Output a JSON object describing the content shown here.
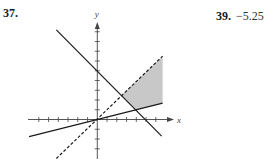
{
  "problems": [
    {
      "number": "37.",
      "kind": "graph"
    },
    {
      "number": "39.",
      "answer": "−5.25"
    }
  ],
  "chart_data": {
    "type": "region-graph",
    "title": "",
    "xlabel": "x",
    "ylabel": "y",
    "xlim": [
      -7,
      7
    ],
    "ylim": [
      -4,
      10
    ],
    "x_ticks": [
      -6,
      -5,
      -4,
      -3,
      -2,
      -1,
      1,
      2,
      3,
      4,
      5,
      6
    ],
    "y_ticks": [
      -3,
      -2,
      -1,
      1,
      2,
      3,
      4,
      5,
      6,
      7,
      8,
      9
    ],
    "tick_labels_shown": false,
    "grid": false,
    "lines": [
      {
        "name": "x + y = 5",
        "style": "solid",
        "points": [
          [
            -4.2,
            9.2
          ],
          [
            6.6,
            -1.7
          ]
        ]
      },
      {
        "name": "y = x/4",
        "style": "solid",
        "points": [
          [
            -7,
            -1.75
          ],
          [
            6.7,
            1.675
          ]
        ]
      },
      {
        "name": "y = x",
        "style": "dashed",
        "points": [
          [
            -4.2,
            -4.0
          ],
          [
            6.7,
            6.5
          ]
        ]
      }
    ],
    "shaded_region": {
      "fill": "#c8c8c8",
      "vertices": [
        [
          2.5,
          2.5
        ],
        [
          6.7,
          6.5
        ],
        [
          6.7,
          1.675
        ],
        [
          4,
          1
        ]
      ]
    },
    "intersections": [
      [
        2.5,
        2.5
      ],
      [
        4,
        1
      ],
      [
        0,
        0
      ]
    ]
  },
  "colors": {
    "line": "#1a1a1a",
    "shade": "#c8c8c8",
    "axis": "#444444"
  }
}
